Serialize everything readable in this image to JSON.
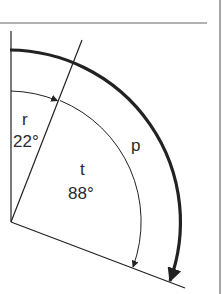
{
  "diagram": {
    "labels": {
      "r": "r",
      "r_angle": "22°",
      "t": "t",
      "t_angle": "88°",
      "p": "p"
    },
    "angles": {
      "r_degrees": 22,
      "t_degrees": 88
    },
    "colors": {
      "line": "#222222",
      "border": "#666666"
    }
  }
}
